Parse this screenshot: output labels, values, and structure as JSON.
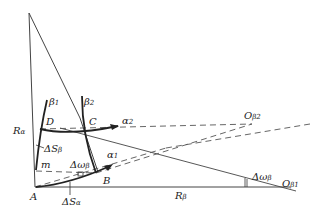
{
  "diagram": {
    "type": "geometry",
    "points": {
      "A": "A",
      "B": "B",
      "C": "C",
      "D": "D",
      "m": "m"
    },
    "labels": {
      "R_alpha": "R",
      "R_alpha_sub": "α",
      "R_beta": "R",
      "R_beta_sub": "β",
      "beta1": "β",
      "beta1_sub": "1",
      "beta2": "β",
      "beta2_sub": "2",
      "alpha1": "α",
      "alpha1_sub": "1",
      "alpha2": "α",
      "alpha2_sub": "2",
      "dS_beta": "ΔS",
      "dS_beta_sub": "β",
      "dS_alpha": "ΔS",
      "dS_alpha_sub": "α",
      "dw_beta_inner": "Δω",
      "dw_beta_inner_sub": "β",
      "dw_beta_outer": "Δω",
      "dw_beta_outer_sub": "β",
      "O_beta1": "O",
      "O_beta1_sub": "β1",
      "O_beta2": "O",
      "O_beta2_sub": "β2"
    },
    "colors": {
      "line": "#333333",
      "dashed": "#555555"
    }
  }
}
